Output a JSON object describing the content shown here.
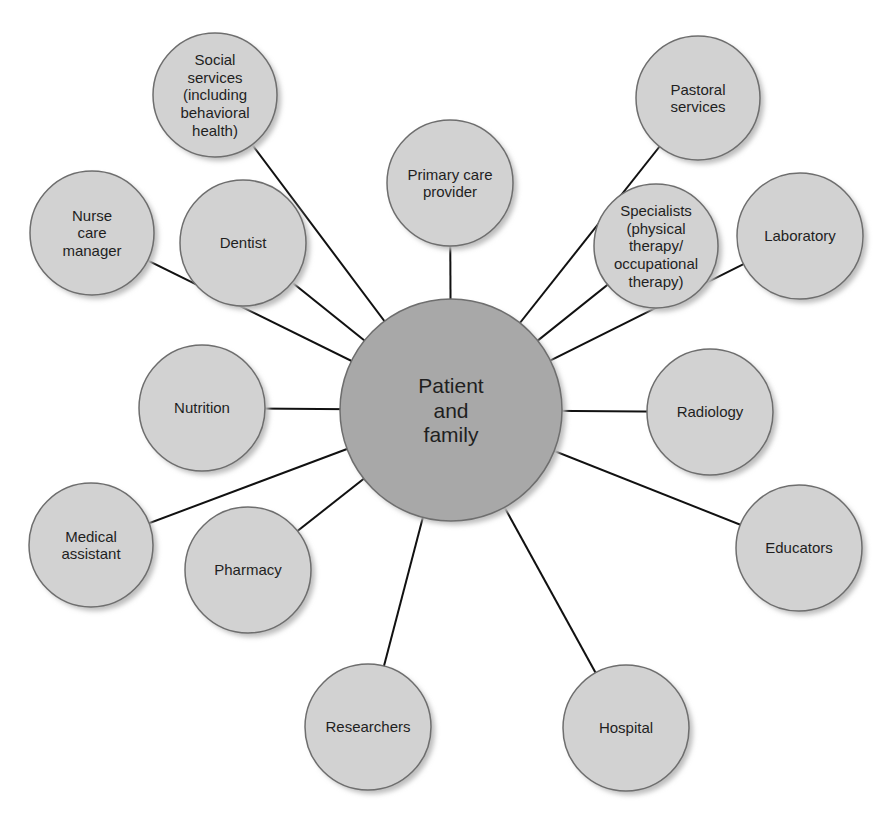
{
  "diagram": {
    "type": "hub-and-spoke",
    "colors": {
      "background": "#ffffff",
      "hub_fill": "#a8a8a8",
      "node_fill": "#d2d2d2",
      "stroke": "#6e6e6e",
      "connector": "#111111",
      "shadow": "#bdbdbd",
      "text": "#1f1f1f"
    },
    "hub": {
      "id": "patient-and-family",
      "lines": [
        "Patient",
        "and",
        "family"
      ],
      "cx": 451,
      "cy": 410,
      "r": 111,
      "font_size": 21
    },
    "nodes": [
      {
        "id": "social-services",
        "lines": [
          "Social",
          "services",
          "(including",
          "behavioral",
          "health)"
        ],
        "cx": 215,
        "cy": 95,
        "r": 62,
        "font_size": 15
      },
      {
        "id": "primary-care-provider",
        "lines": [
          "Primary care",
          "provider"
        ],
        "cx": 450,
        "cy": 183,
        "r": 63,
        "font_size": 15
      },
      {
        "id": "pastoral-services",
        "lines": [
          "Pastoral",
          "services"
        ],
        "cx": 698,
        "cy": 98,
        "r": 62,
        "font_size": 15
      },
      {
        "id": "nurse-care-manager",
        "lines": [
          "Nurse",
          "care",
          "manager"
        ],
        "cx": 92,
        "cy": 233,
        "r": 62,
        "font_size": 15
      },
      {
        "id": "dentist",
        "lines": [
          "Dentist"
        ],
        "cx": 243,
        "cy": 243,
        "r": 63,
        "font_size": 15
      },
      {
        "id": "specialists",
        "lines": [
          "Specialists",
          "(physical",
          "therapy/",
          "occupational",
          "therapy)"
        ],
        "cx": 656,
        "cy": 246,
        "r": 62,
        "font_size": 15
      },
      {
        "id": "laboratory",
        "lines": [
          "Laboratory"
        ],
        "cx": 800,
        "cy": 236,
        "r": 63,
        "font_size": 15
      },
      {
        "id": "nutrition",
        "lines": [
          "Nutrition"
        ],
        "cx": 202,
        "cy": 408,
        "r": 63,
        "font_size": 15
      },
      {
        "id": "radiology",
        "lines": [
          "Radiology"
        ],
        "cx": 710,
        "cy": 412,
        "r": 63,
        "font_size": 15
      },
      {
        "id": "medical-assistant",
        "lines": [
          "Medical",
          "assistant"
        ],
        "cx": 91,
        "cy": 545,
        "r": 62,
        "font_size": 15
      },
      {
        "id": "pharmacy",
        "lines": [
          "Pharmacy"
        ],
        "cx": 248,
        "cy": 570,
        "r": 63,
        "font_size": 15
      },
      {
        "id": "educators",
        "lines": [
          "Educators"
        ],
        "cx": 799,
        "cy": 548,
        "r": 63,
        "font_size": 15
      },
      {
        "id": "researchers",
        "lines": [
          "Researchers"
        ],
        "cx": 368,
        "cy": 727,
        "r": 63,
        "font_size": 15
      },
      {
        "id": "hospital",
        "lines": [
          "Hospital"
        ],
        "cx": 626,
        "cy": 728,
        "r": 63,
        "font_size": 15
      }
    ]
  }
}
